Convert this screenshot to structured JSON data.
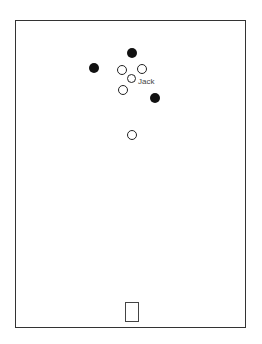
{
  "diagram": {
    "frame": {
      "left": 15,
      "top": 20,
      "width": 231,
      "height": 308
    },
    "filled_dots": [
      {
        "x": 132,
        "y": 53
      },
      {
        "x": 94,
        "y": 68
      },
      {
        "x": 155,
        "y": 98
      }
    ],
    "hollow_dots": [
      {
        "x": 122,
        "y": 70
      },
      {
        "x": 142,
        "y": 69
      },
      {
        "x": 132,
        "y": 79
      },
      {
        "x": 123,
        "y": 90
      },
      {
        "x": 132,
        "y": 135
      }
    ],
    "label": {
      "text": "Jack",
      "x": 138,
      "y": 78
    },
    "goal_box": {
      "left": 125,
      "top": 302,
      "width": 14,
      "height": 20
    }
  }
}
